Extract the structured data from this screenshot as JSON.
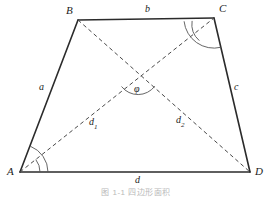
{
  "figure": {
    "type": "geometry-diagram",
    "shape": "quadrilateral",
    "caption": "图 1-1  四边形面积",
    "stroke_color": "#2b2b2b",
    "dash_color": "#4a4a4a",
    "background": "#ffffff",
    "vertices": [
      {
        "name": "A",
        "label": "A",
        "x": 20,
        "y": 172,
        "label_x": 9,
        "label_y": 172
      },
      {
        "name": "B",
        "label": "B",
        "x": 78,
        "y": 20,
        "label_x": 68,
        "label_y": 11
      },
      {
        "name": "C",
        "label": "C",
        "x": 214,
        "y": 18,
        "label_x": 219,
        "label_y": 9
      },
      {
        "name": "D",
        "label": "D",
        "x": 250,
        "y": 172,
        "label_x": 255,
        "label_y": 172
      }
    ],
    "sides": [
      {
        "name": "side-ab",
        "label": "a",
        "from": "A",
        "to": "B",
        "label_x": 39,
        "label_y": 88
      },
      {
        "name": "side-bc",
        "label": "b",
        "from": "B",
        "to": "C",
        "label_x": 145,
        "label_y": 9
      },
      {
        "name": "side-cd",
        "label": "c",
        "from": "C",
        "to": "D",
        "label_x": 235,
        "label_y": 88
      },
      {
        "name": "side-da",
        "label": "d",
        "from": "D",
        "to": "A",
        "label_x": 135,
        "label_y": 178
      }
    ],
    "diagonals": [
      {
        "name": "diagonal-ac",
        "label": "d",
        "subscript": "1",
        "from": "A",
        "to": "C",
        "label_x": 89,
        "label_y": 119
      },
      {
        "name": "diagonal-bd",
        "label": "d",
        "subscript": "2",
        "from": "B",
        "to": "D",
        "label_x": 176,
        "label_y": 117
      }
    ],
    "intersection": {
      "name": "diagonal-intersection",
      "x": 138,
      "y": 73
    },
    "angles": [
      {
        "name": "angle-phi",
        "label": "φ",
        "label_x": 136,
        "label_y": 88,
        "at": "intersection"
      },
      {
        "name": "angle-a-outer",
        "at": "A",
        "arc_radius": 28
      },
      {
        "name": "angle-a-inner",
        "at": "A",
        "arc_radius": 20
      },
      {
        "name": "angle-c-outer",
        "at": "C",
        "arc_radius": 30
      },
      {
        "name": "angle-c-inner",
        "at": "C",
        "arc_radius": 22
      }
    ]
  }
}
